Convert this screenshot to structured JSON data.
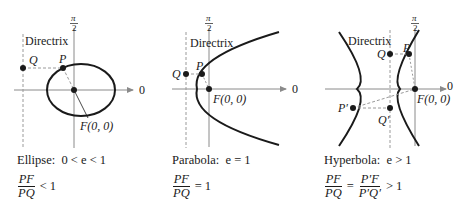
{
  "panels": [
    {
      "name": "ellipse",
      "directrix_label": "Directrix",
      "axis_top_label_num": "π",
      "axis_top_label_den": "2",
      "axis_right_label": "0",
      "points": {
        "P": "P",
        "Q": "Q",
        "F": "F(0, 0)"
      },
      "caption_name": "Ellipse:",
      "caption_condition": "0 < e < 1",
      "ratio_num": "PF",
      "ratio_den": "PQ",
      "ratio_result": "< 1"
    },
    {
      "name": "parabola",
      "directrix_label": "Directrix",
      "axis_top_label_num": "π",
      "axis_top_label_den": "2",
      "axis_right_label": "0",
      "points": {
        "P": "P",
        "Q": "Q",
        "F": "F(0, 0)"
      },
      "caption_name": "Parabola:",
      "caption_condition": "e = 1",
      "ratio_num": "PF",
      "ratio_den": "PQ",
      "ratio_result": "= 1"
    },
    {
      "name": "hyperbola",
      "directrix_label": "Directrix",
      "axis_top_label_num": "π",
      "axis_top_label_den": "2",
      "axis_right_label": "0",
      "points": {
        "P": "P",
        "Q": "Q",
        "P2": "P′",
        "Q2": "Q′",
        "F": "F(0, 0)"
      },
      "caption_name": "Hyperbola:",
      "caption_condition": "e > 1",
      "ratio_num": "PF",
      "ratio_den": "PQ",
      "ratio2_num": "P′F",
      "ratio2_den": "P′Q′",
      "ratio_eq": "=",
      "ratio_result": "> 1"
    }
  ],
  "colors": {
    "curve": "#1a1a1a",
    "axis": "#8a8a8a",
    "dashed": "#9a9a9a"
  }
}
